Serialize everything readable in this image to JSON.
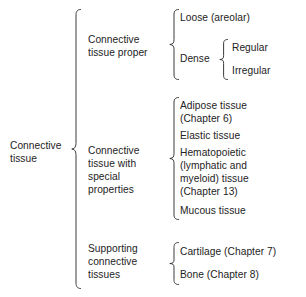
{
  "diagram": {
    "root": {
      "label": "Connective\ntissue"
    },
    "level2": {
      "proper": "Connective\ntissue proper",
      "special": "Connective\ntissue with\nspecial properties",
      "supporting": "Supporting\nconnective\ntissues"
    },
    "proper_children": {
      "loose": "Loose (areolar)",
      "dense": "Dense"
    },
    "dense_children": {
      "regular": "Regular",
      "irregular": "Irregular"
    },
    "special_children": {
      "adipose": "Adipose tissue\n(Chapter 6)",
      "elastic": "Elastic tissue",
      "hematopoietic": "Hematopoietic\n(lymphatic and\nmyeloid) tissue\n(Chapter 13)",
      "mucous": "Mucous tissue"
    },
    "supporting_children": {
      "cartilage": "Cartilage (Chapter 7)",
      "bone": "Bone (Chapter 8)"
    },
    "colors": {
      "text": "#232323",
      "brace": "#3a3a3a",
      "background": "#ffffff"
    }
  }
}
